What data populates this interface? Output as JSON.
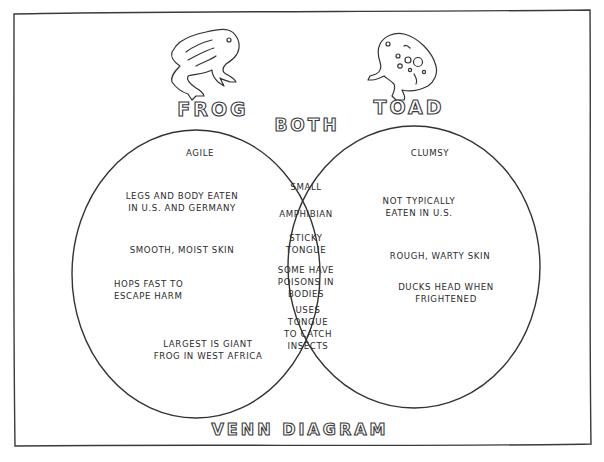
{
  "diagram": {
    "title": "VENN DIAGRAM",
    "overlap_label": "BOTH",
    "colors": {
      "ink": "#2b2b2b",
      "paper": "#ffffff"
    },
    "sets": [
      {
        "name": "FROG",
        "icon": "frog-illustration",
        "heading": "AGILE",
        "items": [
          [
            "LEGS AND BODY EATEN",
            "IN U.S. AND GERMANY"
          ],
          [
            "SMOOTH, MOIST SKIN"
          ],
          [
            "HOPS FAST TO",
            "ESCAPE HARM"
          ],
          [
            "LARGEST IS GIANT",
            "FROG IN WEST AFRICA"
          ]
        ]
      },
      {
        "name": "TOAD",
        "icon": "toad-illustration",
        "heading": "CLUMSY",
        "items": [
          [
            "NOT TYPICALLY",
            "EATEN IN U.S."
          ],
          [
            "ROUGH, WARTY SKIN"
          ],
          [
            "DUCKS HEAD WHEN",
            "FRIGHTENED"
          ]
        ]
      }
    ],
    "both": {
      "items": [
        [
          "SMALL"
        ],
        [
          "AMPHIBIAN"
        ],
        [
          "STICKY",
          "TONGUE"
        ],
        [
          "SOME HAVE",
          "POISONS IN",
          "BODIES"
        ],
        [
          "USES",
          "TONGUE",
          "TO CATCH",
          "INSECTS"
        ]
      ]
    }
  }
}
